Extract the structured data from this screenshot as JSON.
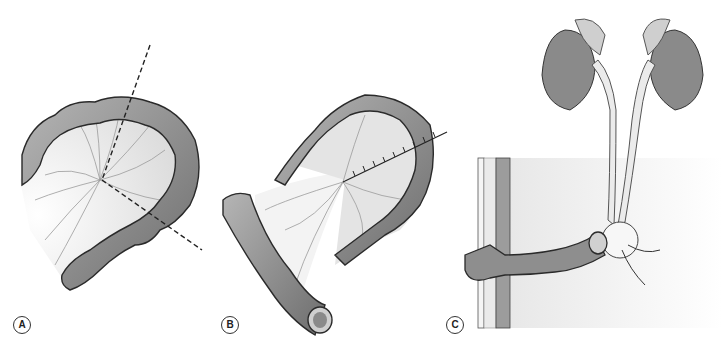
{
  "figure": {
    "panels": [
      {
        "id": "A",
        "label": "A",
        "description": "Colon segment with mesentery and dashed incision lines"
      },
      {
        "id": "B",
        "label": "B",
        "description": "Isolated colon segment with sutured mesentery"
      },
      {
        "id": "C",
        "label": "C",
        "description": "Kidneys and ureters anastomosed to colon conduit brought through abdominal wall"
      }
    ],
    "colors": {
      "bowel_fill": "#8e8e8e",
      "bowel_stroke": "#2a2a2a",
      "mesentery_fill": "#ececec",
      "background_shade": "#eeeeee",
      "kidney_fill": "#8a8a8a",
      "adrenal_fill": "#cfcfcf"
    }
  }
}
